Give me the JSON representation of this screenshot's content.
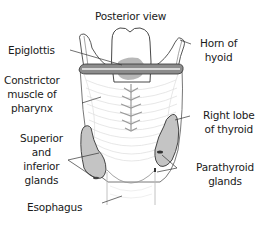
{
  "diagram": {
    "title": "Posterior view",
    "labels": {
      "epiglottis": [
        "Epiglottis"
      ],
      "horn_of_hyoid": [
        "Horn of",
        "hyoid"
      ],
      "constrictor_muscle": [
        "Constrictor",
        "muscle of",
        "pharynx"
      ],
      "right_lobe_thyroid": [
        "Right lobe",
        "of thyroid"
      ],
      "superior_inferior_glands": [
        "Superior",
        "and",
        "inferior",
        "glands"
      ],
      "parathyroid_glands": [
        "Parathyroid",
        "glands"
      ],
      "esophagus": [
        "Esophagus"
      ]
    },
    "colors": {
      "outline": "#333333",
      "fill_gray": "#c4c4c4",
      "fill_dark": "#a8a8a8",
      "muscle_lines": "#d4d4d4",
      "text": "#1a1a1a"
    }
  }
}
